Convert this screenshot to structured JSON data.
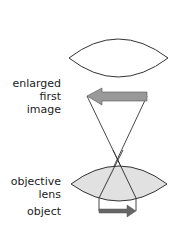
{
  "labels": {
    "enlarged_image": [
      "enlarged",
      "first",
      "image"
    ],
    "objective_lens": [
      "objective",
      "lens"
    ],
    "object": "object"
  },
  "colors": {
    "lens_fill_objective": "#dcdcdc",
    "lens_fill_upper": "#ffffff",
    "arrow_image": "#999999",
    "arrow_object": "#666666",
    "line": "#333333"
  }
}
